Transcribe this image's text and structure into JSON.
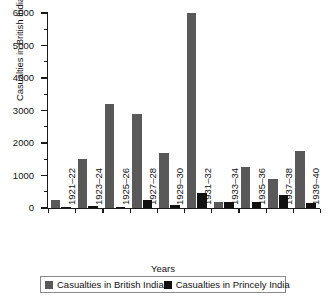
{
  "chart_data": {
    "type": "bar",
    "title": "",
    "xlabel": "Years",
    "ylabel": "Casualties in British India",
    "categories": [
      "1921–22",
      "1923–24",
      "1925–26",
      "1927–28",
      "1929–30",
      "1931–32",
      "1933–34",
      "1935–36",
      "1937–38",
      "1939–40"
    ],
    "series": [
      {
        "name": "Casualties in British India",
        "color": "#595959",
        "values": [
          250,
          1500,
          3200,
          2880,
          1680,
          6000,
          200,
          1250,
          880,
          1750
        ]
      },
      {
        "name": "Casualties in Princely India",
        "color": "#111111",
        "values": [
          30,
          60,
          30,
          250,
          100,
          450,
          200,
          180,
          400,
          150
        ]
      }
    ],
    "ylim": [
      0,
      6000
    ],
    "ytick_labels": [
      "0",
      "1000",
      "2000",
      "3000",
      "4000",
      "5000",
      "6000"
    ],
    "ytick_values": [
      0,
      1000,
      2000,
      3000,
      4000,
      5000,
      6000
    ],
    "yminor_values": [
      500,
      1500,
      2500,
      3500,
      4500,
      5500
    ],
    "grid": false,
    "legend_position": "bottom"
  },
  "legend": {
    "items": [
      {
        "label": "Casualties in British India",
        "color": "#595959"
      },
      {
        "label": "Casualties in Princely India",
        "color": "#111111"
      }
    ]
  }
}
